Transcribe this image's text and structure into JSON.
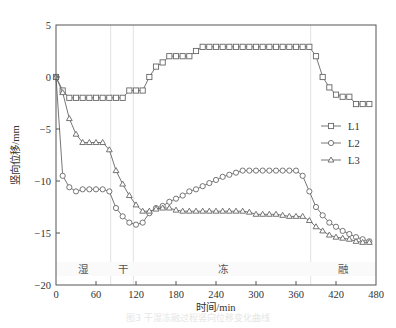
{
  "chart_data": {
    "type": "line",
    "title": "",
    "xlabel": "时间/min",
    "ylabel": "竖向位移/mm",
    "xlim": [
      0,
      480
    ],
    "ylim": [
      -20,
      5
    ],
    "xticks": [
      0,
      60,
      120,
      180,
      240,
      300,
      360,
      420,
      480
    ],
    "yticks": [
      5,
      0,
      -5,
      -10,
      -15,
      -20
    ],
    "grid": false,
    "legend_position": "right-middle",
    "phase_dividers": [
      82,
      116,
      382
    ],
    "phases": [
      {
        "label": "湿",
        "x": 40
      },
      {
        "label": "干",
        "x": 100
      },
      {
        "label": "冻",
        "x": 250
      },
      {
        "label": "融",
        "x": 430
      }
    ],
    "x": [
      0,
      10,
      20,
      30,
      40,
      50,
      60,
      70,
      80,
      90,
      100,
      110,
      120,
      130,
      140,
      150,
      160,
      170,
      180,
      190,
      200,
      210,
      220,
      230,
      240,
      250,
      260,
      270,
      280,
      290,
      300,
      310,
      320,
      330,
      340,
      350,
      360,
      370,
      380,
      390,
      400,
      410,
      420,
      430,
      440,
      450,
      460,
      470
    ],
    "series": [
      {
        "name": "L1",
        "marker": "square",
        "values": [
          0,
          -1.3,
          -2,
          -2,
          -2,
          -2,
          -2,
          -2,
          -2,
          -2,
          -2,
          -1.3,
          -1.3,
          -1.3,
          0,
          1,
          1.4,
          2,
          2,
          2,
          2,
          2.5,
          2.9,
          2.9,
          2.9,
          2.9,
          2.9,
          2.9,
          2.9,
          2.9,
          2.9,
          2.9,
          2.9,
          2.9,
          2.9,
          2.9,
          2.9,
          2.9,
          2.9,
          2,
          0,
          -1,
          -1.7,
          -1.9,
          -1.9,
          -2.6,
          -2.6,
          -2.6
        ]
      },
      {
        "name": "L2",
        "marker": "circle",
        "values": [
          0,
          -9.5,
          -10.6,
          -11,
          -10.8,
          -10.8,
          -10.8,
          -10.8,
          -11,
          -12.6,
          -13.4,
          -14,
          -14.2,
          -14,
          -13.1,
          -12.6,
          -12.4,
          -12,
          -11.7,
          -11.4,
          -11,
          -10.8,
          -10.5,
          -10.2,
          -9.9,
          -9.6,
          -9.4,
          -9.2,
          -9,
          -9,
          -9,
          -9,
          -9,
          -9,
          -9,
          -9,
          -9,
          -9.5,
          -11,
          -12.5,
          -13.3,
          -14,
          -14.4,
          -14.8,
          -15.1,
          -15.4,
          -15.6,
          -15.8
        ]
      },
      {
        "name": "L3",
        "marker": "triangle",
        "values": [
          0,
          -1.5,
          -4,
          -5.5,
          -6.3,
          -6.3,
          -6.3,
          -6.3,
          -7,
          -9,
          -10.3,
          -11.4,
          -12.3,
          -12.9,
          -12.9,
          -12.7,
          -12.6,
          -12.6,
          -12.8,
          -12.9,
          -12.9,
          -12.9,
          -12.9,
          -12.9,
          -12.9,
          -12.9,
          -12.9,
          -12.9,
          -12.9,
          -13,
          -13.2,
          -13.2,
          -13.2,
          -13.2,
          -13.3,
          -13.4,
          -13.4,
          -13.4,
          -13.8,
          -14.4,
          -14.8,
          -15.2,
          -15.4,
          -15.5,
          -15.6,
          -15.8,
          -15.9,
          -15.9
        ]
      }
    ]
  },
  "caption": "图3 干湿冻融过程竖向位移变化曲线"
}
